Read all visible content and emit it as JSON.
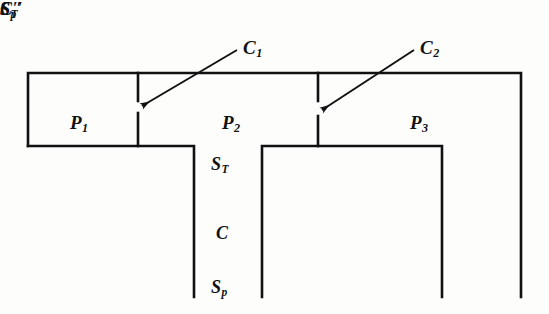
{
  "figure": {
    "background_color": "#fdfdfc",
    "line_color": "#111111"
  },
  "regions": [
    {
      "id": "P1",
      "base": "P",
      "subscript": "1",
      "x": 70,
      "y": 113
    },
    {
      "id": "P2",
      "base": "P",
      "subscript": "2",
      "x": 222,
      "y": 113
    },
    {
      "id": "P3",
      "base": "P",
      "subscript": "3",
      "x": 410,
      "y": 113
    }
  ],
  "callouts": [
    {
      "id": "C1",
      "base": "C",
      "subscript": "1",
      "x": 243,
      "y": 38,
      "arrow_from": [
        237,
        50
      ],
      "arrow_to": [
        142,
        106
      ]
    },
    {
      "id": "C2",
      "base": "C",
      "subscript": "2",
      "x": 420,
      "y": 38,
      "arrow_from": [
        414,
        50
      ],
      "arrow_to": [
        322,
        110
      ]
    }
  ],
  "side_labels": [
    {
      "id": "ST",
      "base": "S",
      "subscript": "T",
      "prime": "",
      "x": 211,
      "y": 155
    },
    {
      "id": "C",
      "base": "C",
      "subscript": "",
      "prime": "",
      "x": 216,
      "y": 224
    },
    {
      "id": "Sp",
      "base": "S",
      "subscript": "p",
      "prime": "",
      "x": 211,
      "y": 278
    },
    {
      "id": "STprime",
      "base": "S",
      "subscript": "T",
      "prime": "′",
      "x": 462,
      "y": 155
    },
    {
      "id": "Cprime",
      "base": "C",
      "subscript": "",
      "prime": "′",
      "x": 467,
      "y": 224
    },
    {
      "id": "Spprime",
      "base": "S",
      "subscript": "p",
      "prime": "′",
      "x": 462,
      "y": 278
    }
  ],
  "geometry": {
    "outline_path": "M 28 146 L 28 73 L 521 73 L 521 297",
    "top_bar_bottom_left": "M 28 146 L 194 146 L 194 297",
    "inner_well": "M 262 297 L 262 146 L 442 146 L 442 297",
    "tick_c1_upper": "M 138 73 L 138 101",
    "tick_c1_lower": "M 138 113 L 138 146",
    "tick_c2_upper": "M 318 73 L 318 101",
    "tick_c2_lower": "M 318 116 L 318 146",
    "stroke_width": 2.6,
    "tick_stroke_width": 2.6
  }
}
